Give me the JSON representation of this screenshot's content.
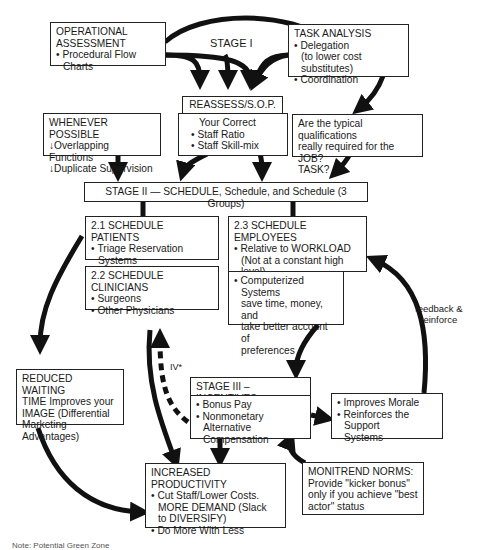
{
  "stage1": {
    "label": "STAGE I",
    "operational_assessment": {
      "title_line1": "OPERATIONAL",
      "title_line2": "ASSESSMENT",
      "bullets": [
        "Procedural Flow Charts"
      ]
    },
    "task_analysis": {
      "title": "TASK ANALYSIS",
      "bullet1": "Delegation",
      "bullet1_sub": "(to lower cost substitutes)",
      "bullet2": "Coordination"
    },
    "reassess": {
      "title": "REASSESS/S.O.P.",
      "intro": "Your Correct",
      "bullets": [
        "Staff Ratio",
        "Staff Skill-mix"
      ]
    },
    "whenever_possible": {
      "title": "WHENEVER POSSIBLE",
      "items": [
        "↓Overlapping Functions",
        "↓Duplicate Supervision"
      ]
    },
    "qualifications": {
      "line1": "Are the typical qualifications",
      "line2": "really required for the JOB?",
      "line3": "TASK?"
    }
  },
  "stage2": {
    "title": "STAGE II — SCHEDULE, Schedule, and Schedule (3 Groups)",
    "patients": {
      "title": "2.1 SCHEDULE PATIENTS",
      "bullet": "Triage Reservation",
      "bullet_cont": "Systems"
    },
    "clinicians": {
      "title": "2.2 SCHEDULE CLINICIANS",
      "bullets": [
        "Surgeons",
        "Other Physicians"
      ]
    },
    "employees": {
      "title": "2.3 SCHEDULE EMPLOYEES",
      "bullet": "Relative to WORKLOAD",
      "cont1": "(Not at a constant high",
      "cont2": "level)"
    },
    "computerized": {
      "bullet": "Computerized Systems",
      "cont1": "save time, money, and",
      "cont2": "take better account of",
      "cont3": "preferences"
    }
  },
  "stage3": {
    "title": "STAGE III – INCENTIVES",
    "bullet1": "Bonus Pay",
    "bullet2": "Nonmonetary",
    "bullet2_cont": "Alternative Compensation",
    "morale": {
      "bullet1": "Improves Morale",
      "bullet2": "Reinforces the Support",
      "bullet2_cont": "Systems"
    },
    "monitrend": {
      "line1": "MONITREND NORMS:",
      "line2": "Provide \"kicker bonus\"",
      "line3": "only if you achieve \"best",
      "line4": "actor\" status"
    }
  },
  "outcomes": {
    "reduced_waiting": {
      "line1": "REDUCED WAITING",
      "line2": "TIME Improves your",
      "line3": "IMAGE (Differential",
      "line4": "Marketing Advantages)"
    },
    "productivity": {
      "title": "INCREASED PRODUCTIVITY",
      "bullet1": "Cut Staff/Lower Costs.",
      "bullet1_cont1": "MORE DEMAND (Slack",
      "bullet1_cont2": "to DIVERSIFY)",
      "bullet2": "Do More With Less"
    }
  },
  "labels": {
    "iv": "IV*",
    "feedback_line1": "feedback &",
    "feedback_line2": "reinforce"
  },
  "footnote": "Note: Potential Green Zone"
}
